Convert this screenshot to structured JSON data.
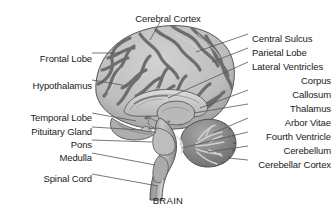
{
  "figure": {
    "caption": "BRAIN",
    "style": "grayscale anatomical illustration"
  },
  "colors": {
    "background": "#ffffff",
    "text": "#1a1a1a",
    "leader_line": "#555555",
    "gyri_light": "#c4c4c4",
    "sulci_dark": "#6e6e6e",
    "outline": "#4a4a4a",
    "cerebellum": "#8f8f8f",
    "cerebellum_dark": "#5e5e5e",
    "brainstem": "#a8a8a8",
    "corpus_callosum": "#cccccc"
  },
  "labels": {
    "top": [
      {
        "text": "Cerebral Cortex",
        "x": 168,
        "y": 13,
        "align": "center"
      }
    ],
    "left": [
      {
        "text": "Frontal Lobe",
        "y": 53,
        "align": "right"
      },
      {
        "text": "Hypothalamus",
        "y": 80,
        "align": "right"
      },
      {
        "text": "Temporal Lobe",
        "y": 112,
        "align": "right"
      },
      {
        "text": "Pituitary Gland",
        "y": 126,
        "align": "right"
      },
      {
        "text": "Pons",
        "y": 139,
        "align": "right"
      },
      {
        "text": "Medulla",
        "y": 152,
        "align": "right"
      },
      {
        "text": "Spinal Cord",
        "y": 173,
        "align": "right"
      }
    ],
    "right": [
      {
        "text": "Central Sulcus",
        "y": 33,
        "align": "left"
      },
      {
        "text": "Parietal Lobe",
        "y": 47,
        "align": "left"
      },
      {
        "text": "Lateral Ventricles",
        "y": 61,
        "align": "left"
      },
      {
        "text": "Corpus",
        "y": 75,
        "align": "right"
      },
      {
        "text": "Callosum",
        "y": 89,
        "align": "right"
      },
      {
        "text": "Thalamus",
        "y": 103,
        "align": "right"
      },
      {
        "text": "Arbor Vitae",
        "y": 117,
        "align": "right"
      },
      {
        "text": "Fourth Ventricle",
        "y": 131,
        "align": "right"
      },
      {
        "text": "Cerebellum",
        "y": 145,
        "align": "right"
      },
      {
        "text": "Cerebellar Cortex",
        "y": 159,
        "align": "right"
      }
    ]
  }
}
